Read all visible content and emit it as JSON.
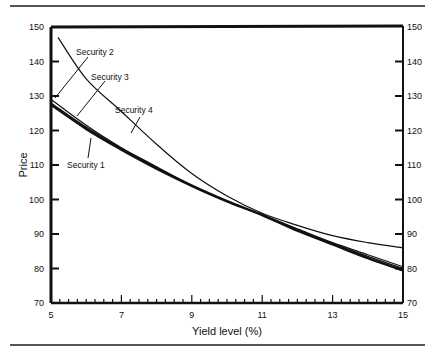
{
  "chart_data": {
    "type": "line",
    "title": "",
    "xlabel": "Yield level (%)",
    "ylabel": "Price",
    "xlim": [
      5,
      15
    ],
    "ylim": [
      70,
      150
    ],
    "x_ticks": [
      "5",
      "7",
      "9",
      "11",
      "13",
      "15"
    ],
    "y_ticks": [
      "70",
      "80",
      "90",
      "100",
      "110",
      "120",
      "130",
      "140",
      "150"
    ],
    "right_y_ticks": [
      "70",
      "80",
      "90",
      "100",
      "110",
      "120",
      "130",
      "140",
      "150"
    ],
    "grid": false,
    "legend": "annotations",
    "x": [
      5,
      6,
      7,
      8,
      9,
      10,
      11,
      12,
      13,
      14,
      15
    ],
    "series": [
      {
        "name": "Security 1",
        "values": [
          127.5,
          120.5,
          114.5,
          109,
          104,
          99.5,
          95.5,
          91,
          87,
          83,
          79.5
        ]
      },
      {
        "name": "Security 2",
        "values": [
          129,
          121.5,
          115,
          109.5,
          104,
          99.5,
          95.5,
          91.5,
          87.5,
          84,
          80.5
        ]
      },
      {
        "name": "Security 3",
        "values": [
          128,
          121,
          114.8,
          109.3,
          104,
          99.5,
          95.5,
          91.3,
          87.3,
          83.5,
          80
        ]
      },
      {
        "name": "Security 4",
        "values": [
          147,
          135,
          125.5,
          116,
          107.5,
          101,
          96,
          92.5,
          89.5,
          87.5,
          86
        ]
      }
    ]
  },
  "labels": {
    "sec1": "Security 1",
    "sec2": "Security 2",
    "sec3": "Security 3",
    "sec4": "Security 4",
    "xlabel": "Yield level (%)",
    "ylabel": "Price"
  },
  "ticks": {
    "x": [
      "5",
      "7",
      "9",
      "11",
      "13",
      "15"
    ],
    "y": [
      "70",
      "80",
      "90",
      "100",
      "110",
      "120",
      "130",
      "140",
      "150"
    ]
  }
}
